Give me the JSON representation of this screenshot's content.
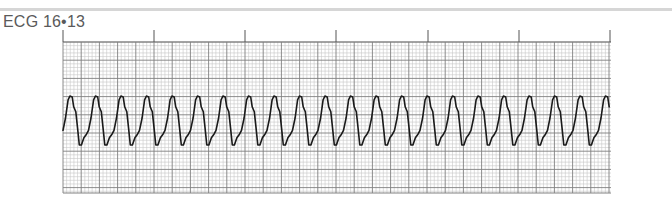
{
  "figure": {
    "title": "ECG 16•13"
  },
  "strip": {
    "x0": 63,
    "x1": 611,
    "y0": 42,
    "y1": 193,
    "small_box_px": 3.64,
    "large_box_px": 18.2,
    "grid_minor_color": "#c8c8c8",
    "grid_major_color": "#808080",
    "waveform_color": "#1a1a1a",
    "time_marker_xs": [
      63,
      154,
      245,
      336,
      428,
      519,
      610
    ],
    "time_marker_top": 30,
    "time_marker_color": "#555555"
  },
  "waveform": {
    "rhythm": "regular wide-complex tachycardia",
    "start_x": 63,
    "period_px": 25.5,
    "peak_y": 96,
    "trough_y": 145,
    "baseline_start_y": 134,
    "complex_count": 22
  }
}
